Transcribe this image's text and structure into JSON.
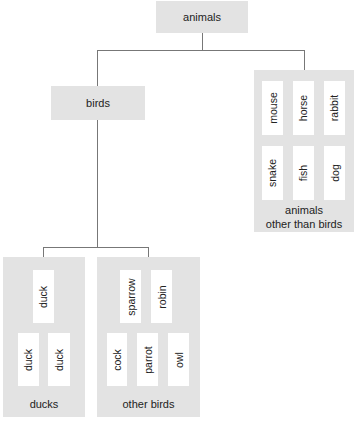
{
  "diagram": {
    "type": "tree",
    "root": {
      "label": "animals"
    },
    "birds": {
      "label": "birds"
    },
    "other_animals": {
      "label_line1": "animals",
      "label_line2": "other than birds",
      "row1": [
        "mouse",
        "horse",
        "rabbit"
      ],
      "row2": [
        "snake",
        "fish",
        "dog"
      ]
    },
    "ducks": {
      "label": "ducks",
      "top": [
        "duck"
      ],
      "bottom": [
        "duck",
        "duck"
      ]
    },
    "other_birds": {
      "label": "other birds",
      "top": [
        "sparrow",
        "robin"
      ],
      "bottom": [
        "cock",
        "parrot",
        "owl"
      ]
    },
    "colors": {
      "box_fill": "#e3e3e3",
      "card_fill": "#ffffff",
      "connector": "#777777",
      "text": "#222222"
    }
  }
}
